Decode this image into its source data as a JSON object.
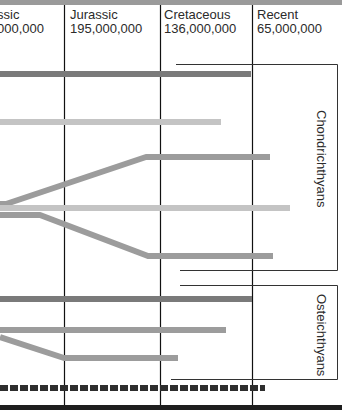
{
  "periods": [
    {
      "name": "Triassic",
      "visible_name": "ssic",
      "years": "225,000,000",
      "visible_years": "000,000"
    },
    {
      "name": "Jurassic",
      "visible_name": "Jurassic",
      "years": "195,000,000",
      "visible_years": "195,000,000"
    },
    {
      "name": "Cretaceous",
      "visible_name": "Cretaceous",
      "years": "136,000,000",
      "visible_years": "136,000,000"
    },
    {
      "name": "Recent",
      "visible_name": "Recent",
      "years": "65,000,000",
      "visible_years": "65,000,000"
    }
  ],
  "groups": [
    {
      "label": "Chondrichthyans"
    },
    {
      "label": "Osteichthyans"
    }
  ],
  "colors": {
    "dark": "#7a7a7a",
    "medium": "#9c9c9c",
    "light": "#c4c4c4",
    "dashed": "#2e2e2e",
    "grid": "#111111"
  },
  "lineages": [
    {
      "group": "Chondrichthyans",
      "shade": "dark",
      "points": [
        [
          0,
          74
        ],
        [
          251,
          74
        ]
      ]
    },
    {
      "group": "Chondrichthyans",
      "shade": "light",
      "points": [
        [
          0,
          122
        ],
        [
          221,
          122
        ]
      ]
    },
    {
      "group": "Chondrichthyans",
      "shade": "medium",
      "points": [
        [
          0,
          204
        ],
        [
          6,
          204
        ],
        [
          146,
          157
        ],
        [
          270,
          157
        ]
      ]
    },
    {
      "group": "Chondrichthyans",
      "shade": "light",
      "points": [
        [
          0,
          208
        ],
        [
          290,
          208
        ]
      ]
    },
    {
      "group": "Chondrichthyans",
      "shade": "medium",
      "points": [
        [
          0,
          215
        ],
        [
          40,
          215
        ],
        [
          148,
          256
        ],
        [
          273,
          256
        ]
      ]
    },
    {
      "group": "Osteichthyans",
      "shade": "dark",
      "points": [
        [
          0,
          299
        ],
        [
          252,
          299
        ]
      ]
    },
    {
      "group": "Osteichthyans",
      "shade": "medium",
      "points": [
        [
          0,
          330
        ],
        [
          226,
          330
        ]
      ]
    },
    {
      "group": "Osteichthyans",
      "shade": "medium",
      "points": [
        [
          0,
          337
        ],
        [
          64,
          358
        ],
        [
          178,
          358
        ]
      ]
    },
    {
      "group": "Osteichthyans",
      "shade": "dashed",
      "points": [
        [
          0,
          388
        ],
        [
          265,
          388
        ]
      ]
    }
  ]
}
